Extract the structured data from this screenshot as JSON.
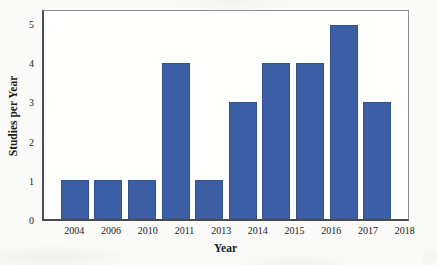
{
  "chart_data": {
    "type": "bar",
    "title": "",
    "xlabel": "Year",
    "ylabel": "Studies per Year",
    "categories": [
      "2004",
      "2006",
      "2010",
      "2011",
      "2013",
      "2014",
      "2015",
      "2016",
      "2017",
      "2018"
    ],
    "values": [
      1,
      1,
      1,
      4,
      1,
      3,
      4,
      4,
      5,
      3
    ],
    "yticks": [
      0,
      1,
      2,
      3,
      4,
      5
    ],
    "ylim": [
      0,
      5.35
    ],
    "grid": "off",
    "legend": "none",
    "bar_color": "#3b5ea5",
    "bar_edge_color": "#32528f",
    "axis_color": "#4d4d4d"
  }
}
